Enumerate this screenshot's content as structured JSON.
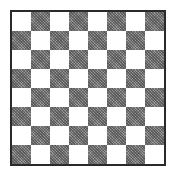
{
  "board": {
    "rows": 8,
    "cols": 8,
    "top_left_color": "light",
    "colors": {
      "light": "#ffffff",
      "dark": "#9a9a9a",
      "border": "#2a2a2a"
    },
    "pieces": []
  }
}
